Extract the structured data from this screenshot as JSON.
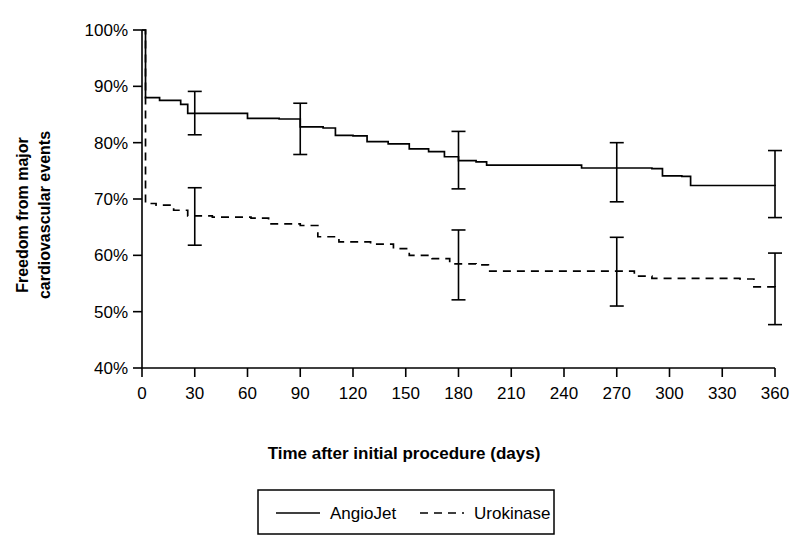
{
  "chart_data": {
    "type": "line",
    "title": "",
    "xlabel": "Time after initial procedure (days)",
    "ylabel": "Freedom from major cardiovascular events",
    "ylabel_line1": "Freedom from major",
    "ylabel_line2": "cardiovascular events",
    "xlim": [
      0,
      360
    ],
    "ylim": [
      40,
      100
    ],
    "xticks": [
      0,
      30,
      60,
      90,
      120,
      150,
      180,
      210,
      240,
      270,
      300,
      330,
      360
    ],
    "xticklabels": [
      "0",
      "30",
      "60",
      "90",
      "120",
      "150",
      "180",
      "210",
      "240",
      "270",
      "300",
      "330",
      "360"
    ],
    "yticks": [
      40,
      50,
      60,
      70,
      80,
      90,
      100
    ],
    "yticklabels": [
      "40%",
      "50%",
      "60%",
      "70%",
      "80%",
      "90%",
      "100%"
    ],
    "grid": false,
    "legend_position": "bottom-center",
    "series": [
      {
        "name": "AngioJet",
        "style": "solid",
        "steps": [
          {
            "x": 0,
            "y": 100.0
          },
          {
            "x": 2,
            "y": 88.0
          },
          {
            "x": 10,
            "y": 87.5
          },
          {
            "x": 22,
            "y": 86.8
          },
          {
            "x": 26,
            "y": 85.2
          },
          {
            "x": 55,
            "y": 85.2
          },
          {
            "x": 60,
            "y": 84.3
          },
          {
            "x": 78,
            "y": 84.2
          },
          {
            "x": 90,
            "y": 82.8
          },
          {
            "x": 103,
            "y": 82.6
          },
          {
            "x": 110,
            "y": 81.3
          },
          {
            "x": 120,
            "y": 81.2
          },
          {
            "x": 128,
            "y": 80.2
          },
          {
            "x": 140,
            "y": 79.8
          },
          {
            "x": 152,
            "y": 78.9
          },
          {
            "x": 163,
            "y": 78.4
          },
          {
            "x": 172,
            "y": 77.5
          },
          {
            "x": 180,
            "y": 76.8
          },
          {
            "x": 190,
            "y": 76.6
          },
          {
            "x": 196,
            "y": 76.0
          },
          {
            "x": 245,
            "y": 76.0
          },
          {
            "x": 250,
            "y": 75.5
          },
          {
            "x": 290,
            "y": 75.4
          },
          {
            "x": 296,
            "y": 74.1
          },
          {
            "x": 307,
            "y": 74.0
          },
          {
            "x": 312,
            "y": 72.4
          },
          {
            "x": 360,
            "y": 72.3
          }
        ],
        "error_bars": [
          {
            "x": 30,
            "y": 85.2,
            "low": 81.4,
            "high": 89.1
          },
          {
            "x": 90,
            "y": 82.3,
            "low": 77.9,
            "high": 87.0
          },
          {
            "x": 180,
            "y": 76.8,
            "low": 71.8,
            "high": 82.0
          },
          {
            "x": 270,
            "y": 74.8,
            "low": 69.5,
            "high": 80.0
          },
          {
            "x": 360,
            "y": 72.3,
            "low": 66.7,
            "high": 78.6
          }
        ]
      },
      {
        "name": "Urokinase",
        "style": "dashed",
        "steps": [
          {
            "x": 0,
            "y": 100.0
          },
          {
            "x": 2,
            "y": 69.2
          },
          {
            "x": 8,
            "y": 68.9
          },
          {
            "x": 18,
            "y": 68.0
          },
          {
            "x": 26,
            "y": 67.0
          },
          {
            "x": 40,
            "y": 66.8
          },
          {
            "x": 62,
            "y": 66.6
          },
          {
            "x": 72,
            "y": 65.6
          },
          {
            "x": 90,
            "y": 65.3
          },
          {
            "x": 100,
            "y": 63.3
          },
          {
            "x": 112,
            "y": 62.4
          },
          {
            "x": 130,
            "y": 62.0
          },
          {
            "x": 143,
            "y": 61.2
          },
          {
            "x": 152,
            "y": 60.0
          },
          {
            "x": 165,
            "y": 59.4
          },
          {
            "x": 175,
            "y": 58.5
          },
          {
            "x": 190,
            "y": 58.3
          },
          {
            "x": 197,
            "y": 57.2
          },
          {
            "x": 272,
            "y": 57.2
          },
          {
            "x": 280,
            "y": 56.3
          },
          {
            "x": 290,
            "y": 55.9
          },
          {
            "x": 340,
            "y": 55.8
          },
          {
            "x": 348,
            "y": 54.4
          },
          {
            "x": 360,
            "y": 54.3
          }
        ],
        "error_bars": [
          {
            "x": 30,
            "y": 66.7,
            "low": 61.8,
            "high": 72.0
          },
          {
            "x": 180,
            "y": 58.3,
            "low": 52.1,
            "high": 64.5
          },
          {
            "x": 270,
            "y": 57.2,
            "low": 51.0,
            "high": 63.2
          },
          {
            "x": 360,
            "y": 54.3,
            "low": 47.7,
            "high": 60.4
          }
        ]
      }
    ],
    "legend": [
      {
        "label": "AngioJet",
        "style": "solid"
      },
      {
        "label": "Urokinase",
        "style": "dashed"
      }
    ]
  }
}
